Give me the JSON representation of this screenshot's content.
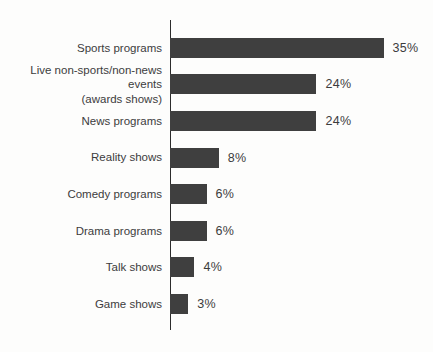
{
  "chart_data": {
    "type": "bar",
    "orientation": "horizontal",
    "title": "",
    "xlabel": "",
    "ylabel": "",
    "grid": false,
    "legend": "none",
    "xlim": [
      0,
      40
    ],
    "categories": [
      "Sports programs",
      "Live non-sports/non-news events\n(awards shows)",
      "News programs",
      "Reality shows",
      "Comedy programs",
      "Drama programs",
      "Talk shows",
      "Game shows"
    ],
    "values": [
      35,
      24,
      24,
      8,
      6,
      6,
      4,
      3
    ],
    "value_labels": [
      "35%",
      "24%",
      "24%",
      "8%",
      "6%",
      "6%",
      "4%",
      "3%"
    ],
    "colors": {
      "bar": "#3f3f3f",
      "axis": "#2c2c2c",
      "label": "#3c3c3c",
      "background": "#fdfdfc"
    }
  }
}
